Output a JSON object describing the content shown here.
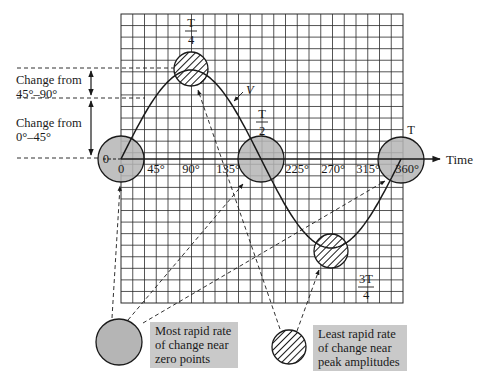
{
  "diagram": {
    "curve_label": "V",
    "axis_label": "Time",
    "origin_value_label": "0",
    "ticks": [
      "0",
      "45°",
      "90°",
      "135°",
      "225°",
      "270°",
      "315°",
      "360°"
    ],
    "period_marks": {
      "quarter": {
        "num": "T",
        "den": "4"
      },
      "half": {
        "num": "T",
        "den": "2"
      },
      "three_quarter": {
        "num": "3T",
        "den": "4"
      },
      "full": "T"
    },
    "side_annotations": [
      {
        "line1": "Change from",
        "line2": "45°–90°"
      },
      {
        "line1": "Change from",
        "line2": "0°–45°"
      }
    ],
    "legend": [
      {
        "type": "solid-gray-circle",
        "line1": "Most rapid rate",
        "line2": "of change near",
        "line3": "zero points"
      },
      {
        "type": "hatched-circle",
        "line1": "Least rapid rate",
        "line2": "of change near",
        "line3": "peak amplitudes"
      }
    ],
    "colors": {
      "circle_fill": "#b5b5b5",
      "label_box": "#c9c9c9",
      "grid": "#2a2a2a",
      "ink": "#1a1a1a"
    }
  }
}
